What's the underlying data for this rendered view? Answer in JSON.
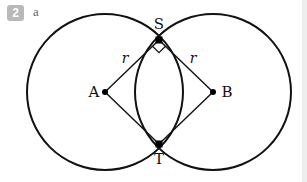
{
  "question": {
    "number": "2",
    "part": "a"
  },
  "diagram": {
    "points": {
      "A": {
        "label": "A",
        "x": 105,
        "y": 92
      },
      "B": {
        "label": "B",
        "x": 213,
        "y": 92
      },
      "S": {
        "label": "S",
        "x": 159,
        "y": 40
      },
      "T": {
        "label": "T",
        "x": 159,
        "y": 144
      }
    },
    "radius_label_left": "r",
    "radius_label_right": "r",
    "circle_radius_px": 78,
    "right_angle_at": "S"
  }
}
